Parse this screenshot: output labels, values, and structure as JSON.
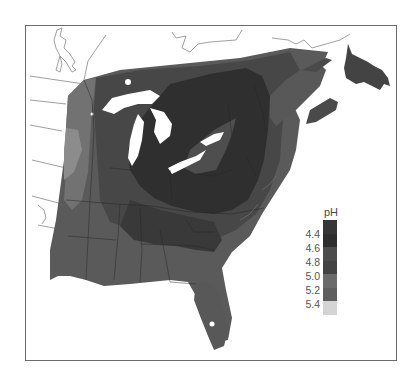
{
  "map": {
    "title": "",
    "region": "Eastern United States and southeastern Canada",
    "variable": "Precipitation pH"
  },
  "legend": {
    "title": "pH",
    "labels": [
      "4.4",
      "4.6",
      "4.8",
      "5.0",
      "5.2",
      "5.4"
    ],
    "swatches": [
      {
        "from": "<4.4",
        "color": "#363636"
      },
      {
        "from": "4.4-4.6",
        "color": "#2e2e2e"
      },
      {
        "from": "4.6-4.8",
        "color": "#4c4c4c"
      },
      {
        "from": "4.8-5.0",
        "color": "#434343"
      },
      {
        "from": "5.0-5.2",
        "color": "#6a6a6a"
      },
      {
        "from": "5.2-5.4",
        "color": "#5e5e5e"
      },
      {
        "from": ">5.4",
        "color": "#d4d4d4"
      }
    ]
  },
  "colors": {
    "frame": "#6a6a6a",
    "water": "#ffffff",
    "border_lines": "#2a2a2a",
    "outline_lines": "#888888"
  }
}
